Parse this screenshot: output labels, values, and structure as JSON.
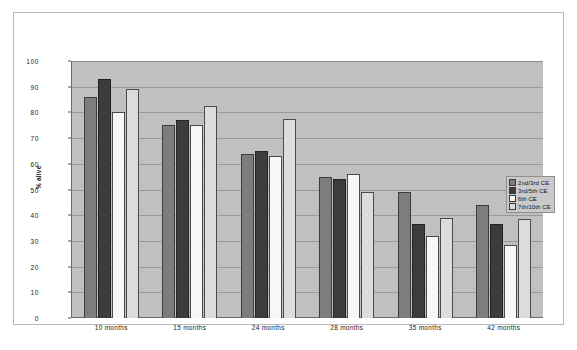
{
  "chart_data": {
    "type": "bar",
    "title": "",
    "xlabel": "",
    "ylabel": "% alive",
    "ylim": [
      0,
      100
    ],
    "ytick_step": 10,
    "grid": true,
    "legend_position": "right",
    "categories": [
      "10 months",
      "15 months",
      "24 months",
      "28 months",
      "35 months",
      "42 months"
    ],
    "yticks": [
      "100",
      "90",
      "80",
      "70",
      "60",
      "50",
      "40",
      "30",
      "20",
      "10",
      "0"
    ],
    "series": [
      {
        "name": "2nd/3rd CE",
        "color": "#7d7d7d",
        "values": [
          86,
          75,
          64,
          55,
          49,
          44
        ]
      },
      {
        "name": "3rd/5th CE",
        "color": "#3c3c3c",
        "values": [
          93,
          77,
          65,
          54,
          36.5,
          36.5
        ]
      },
      {
        "name": "6th CE",
        "color": "#f7f7f7",
        "values": [
          80,
          75,
          63,
          56,
          32,
          28.5
        ]
      },
      {
        "name": "7th/10th CE",
        "color": "#dcdcdc",
        "values": [
          89,
          82.5,
          77.5,
          49,
          39,
          38.5
        ]
      }
    ]
  },
  "caption": ""
}
